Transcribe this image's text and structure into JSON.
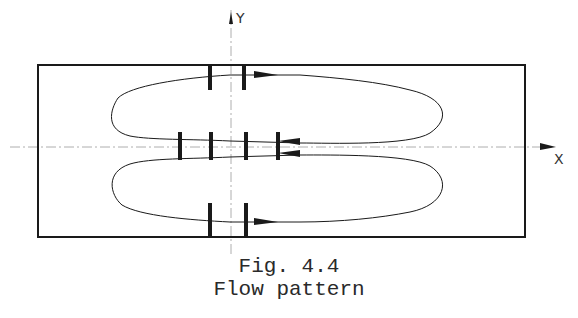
{
  "figure": {
    "caption_number": "Fig. 4.4",
    "caption_title": "Flow pattern",
    "axes": {
      "x_label": "X",
      "y_label": "Y"
    }
  },
  "diagram": {
    "frame": {
      "x": 38,
      "y": 65,
      "width": 487,
      "height": 172
    },
    "loops": [
      {
        "name": "upper",
        "direction": "clockwise"
      },
      {
        "name": "lower",
        "direction": "counterclockwise"
      }
    ],
    "barriers": {
      "top_pair_x": [
        210,
        244
      ],
      "middle_row_x": [
        180,
        211,
        246,
        278
      ],
      "bottom_pair_x": [
        210,
        244
      ]
    },
    "colors": {
      "line": "#1a1a1a",
      "axis": "#888888"
    }
  }
}
